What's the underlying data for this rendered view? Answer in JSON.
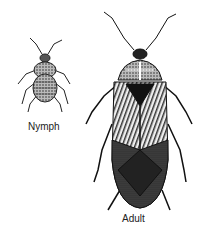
{
  "figure": {
    "specimens": [
      {
        "label": "Nymph"
      },
      {
        "label": "Adult"
      }
    ]
  }
}
